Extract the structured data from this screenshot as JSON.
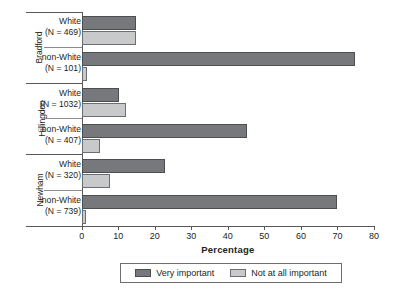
{
  "chart_data": {
    "type": "bar",
    "orientation": "horizontal",
    "title": "",
    "xlabel": "Percentage",
    "ylabel": "",
    "xlim": [
      0,
      80
    ],
    "xticks": [
      0,
      10,
      20,
      30,
      40,
      50,
      60,
      70,
      80
    ],
    "grid": false,
    "legend_position": "bottom",
    "legend": [
      {
        "name": "Very important",
        "color": "#77787b"
      },
      {
        "name": "Not at all important",
        "color": "#c8c9cb"
      }
    ],
    "series": [
      {
        "name": "Very important",
        "color": "#77787b",
        "values": [
          15.0,
          74.9,
          10.2,
          45.2,
          22.8,
          69.9
        ]
      },
      {
        "name": "Not at all important",
        "color": "#c8c9cb",
        "values": [
          14.8,
          1.5,
          12.1,
          5.0,
          7.7,
          1.2
        ]
      }
    ],
    "categories": [
      "Bradford / White (N = 469)",
      "Bradford / non-White (N = 101)",
      "Hillingdon / White (N = 1032)",
      "Hillingdon / non-White (N = 407)",
      "Newham / White (N = 320)",
      "Newham / non-White (N = 739)"
    ],
    "areas": [
      {
        "label": "Bradford",
        "groups": [
          {
            "ethnicity": "White",
            "n_label": "(N = 469)",
            "n": 469,
            "very_important": 15.0,
            "not_at_all_important": 14.8
          },
          {
            "ethnicity": "non-White",
            "n_label": "(N = 101)",
            "n": 101,
            "very_important": 74.9,
            "not_at_all_important": 1.5
          }
        ]
      },
      {
        "label": "Hillingdon",
        "groups": [
          {
            "ethnicity": "White",
            "n_label": "(N = 1032)",
            "n": 1032,
            "very_important": 10.2,
            "not_at_all_important": 12.1
          },
          {
            "ethnicity": "non-White",
            "n_label": "(N = 407)",
            "n": 407,
            "very_important": 45.2,
            "not_at_all_important": 5.0
          }
        ]
      },
      {
        "label": "Newham",
        "groups": [
          {
            "ethnicity": "White",
            "n_label": "(N = 320)",
            "n": 320,
            "very_important": 22.8,
            "not_at_all_important": 7.7
          },
          {
            "ethnicity": "non-White",
            "n_label": "(N = 739)",
            "n": 739,
            "very_important": 69.9,
            "not_at_all_important": 1.2
          }
        ]
      }
    ]
  },
  "axis": {
    "x_title": "Percentage",
    "ticks": [
      "0",
      "10",
      "20",
      "30",
      "40",
      "50",
      "60",
      "70",
      "80"
    ]
  },
  "legend": {
    "items": [
      {
        "label": "Very important"
      },
      {
        "label": "Not at all important"
      }
    ]
  },
  "areas": {
    "bradford": {
      "label": "Bradford",
      "white": {
        "ethnicity": "White",
        "n_label": "(N = 469)"
      },
      "nonwhite": {
        "ethnicity": "non-White",
        "n_label": "(N = 101)"
      }
    },
    "hillingdon": {
      "label": "Hillingdon",
      "white": {
        "ethnicity": "White",
        "n_label": "(N = 1032)"
      },
      "nonwhite": {
        "ethnicity": "non-White",
        "n_label": "(N = 407)"
      }
    },
    "newham": {
      "label": "Newham",
      "white": {
        "ethnicity": "White",
        "n_label": "(N = 320)"
      },
      "nonwhite": {
        "ethnicity": "non-White",
        "n_label": "(N = 739)"
      }
    }
  }
}
